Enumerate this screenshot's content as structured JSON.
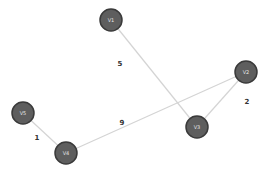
{
  "graph": {
    "node_color": "#5e5e5e",
    "node_border_color": "#3a3a3a",
    "edge_color": "#d4d4d4",
    "nodes": [
      {
        "id": "V1",
        "label": "V1",
        "x": 111,
        "y": 20
      },
      {
        "id": "V2",
        "label": "V2",
        "x": 246,
        "y": 72
      },
      {
        "id": "V3",
        "label": "V3",
        "x": 197,
        "y": 127
      },
      {
        "id": "V4",
        "label": "V4",
        "x": 66,
        "y": 153
      },
      {
        "id": "V5",
        "label": "V5",
        "x": 23,
        "y": 113
      }
    ],
    "edges": [
      {
        "from": "V1",
        "to": "V3",
        "weight": "5",
        "label_x": 120,
        "label_y": 64
      },
      {
        "from": "V4",
        "to": "V2",
        "weight": "9",
        "label_x": 122,
        "label_y": 123
      },
      {
        "from": "V2",
        "to": "V3",
        "weight": "2",
        "label_x": 247,
        "label_y": 102
      },
      {
        "from": "V5",
        "to": "V4",
        "weight": "1",
        "label_x": 37,
        "label_y": 138
      }
    ]
  }
}
